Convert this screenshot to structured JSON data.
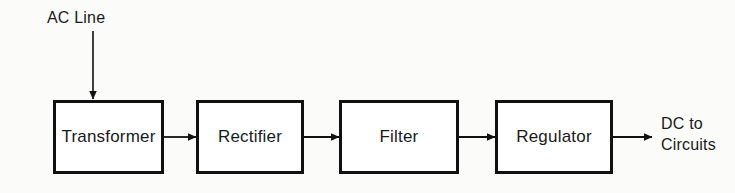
{
  "diagram": {
    "type": "block-diagram",
    "background_color": "#fbfbfa",
    "line_color": "#111111",
    "box_fill_color": "#ffffff",
    "blocks": [
      {
        "id": "transformer",
        "label": "Transformer"
      },
      {
        "id": "rectifier",
        "label": "Rectifier"
      },
      {
        "id": "filter",
        "label": "Filter"
      },
      {
        "id": "regulator",
        "label": "Regulator"
      }
    ],
    "input_label": "AC Line",
    "output_label_line1": "DC to",
    "output_label_line2": "Circuits",
    "connectors": [
      {
        "from": "ac-line",
        "to": "transformer",
        "orientation": "vertical",
        "arrow": true
      },
      {
        "from": "transformer",
        "to": "rectifier",
        "orientation": "horizontal",
        "arrow": true
      },
      {
        "from": "rectifier",
        "to": "filter",
        "orientation": "horizontal",
        "arrow": true
      },
      {
        "from": "filter",
        "to": "regulator",
        "orientation": "horizontal",
        "arrow": true
      },
      {
        "from": "regulator",
        "to": "dc-output",
        "orientation": "horizontal",
        "arrow": true
      }
    ]
  }
}
